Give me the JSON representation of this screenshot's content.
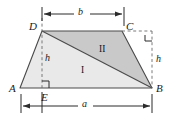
{
  "figure": {
    "colors": {
      "region_one_fill": "#e9e9e9",
      "region_two_fill": "#c9c9c9",
      "outline": "#4a4a4a",
      "dashed": "#6b6b6b",
      "text": "#1a1a1a",
      "background": "#ffffff"
    },
    "vertices": [
      {
        "id": "A",
        "label": "A",
        "x": 20,
        "y": 88,
        "label_x": 9,
        "label_y": 83
      },
      {
        "id": "B",
        "label": "B",
        "x": 152,
        "y": 88,
        "label_x": 156,
        "label_y": 83
      },
      {
        "id": "C",
        "label": "C",
        "x": 122,
        "y": 31,
        "label_x": 126,
        "label_y": 21
      },
      {
        "id": "D",
        "label": "D",
        "x": 42,
        "y": 31,
        "label_x": 29,
        "label_y": 21
      },
      {
        "id": "E",
        "label": "E",
        "x": 42,
        "y": 88,
        "label_x": 41,
        "label_y": 92
      }
    ],
    "regions": [
      {
        "id": "I",
        "label": "I",
        "label_x": 81,
        "label_y": 66
      },
      {
        "id": "II",
        "label": "II",
        "label_x": 99,
        "label_y": 45
      }
    ],
    "dimensions": [
      {
        "id": "b",
        "label": "b",
        "label_x": 81,
        "label_y": 7,
        "axis": "horizontal",
        "x1": 45,
        "x2": 122,
        "y": 14
      },
      {
        "id": "a",
        "label": "a",
        "label_x": 84,
        "label_y": 99,
        "axis": "horizontal",
        "x1": 21,
        "x2": 152,
        "y": 106
      }
    ],
    "heights": [
      {
        "id": "h-left",
        "label": "h",
        "label_x": 45,
        "label_y": 53
      },
      {
        "id": "h-right",
        "label": "h",
        "label_x": 156,
        "label_y": 54
      }
    ],
    "right_angles": [
      {
        "id": "right-angle-E",
        "x": 42,
        "y": 88
      },
      {
        "id": "right-angle-C",
        "x": 150,
        "y": 33
      }
    ]
  }
}
